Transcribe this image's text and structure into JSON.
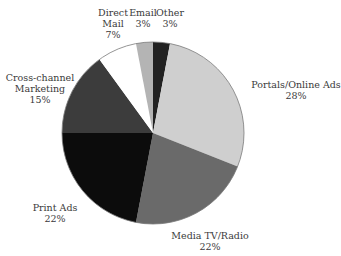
{
  "chart_data": {
    "type": "pie",
    "title": "",
    "start_angle_deg": 0,
    "direction": "clockwise",
    "center": [
      153,
      133
    ],
    "radius": 91,
    "slices": [
      {
        "label": "Other",
        "value": 3,
        "display": "3%",
        "color": "#222222"
      },
      {
        "label": "Portals/Online Ads",
        "value": 28,
        "display": "28%",
        "color": "#cfcfcf"
      },
      {
        "label": "Media TV/Radio",
        "value": 22,
        "display": "22%",
        "color": "#6a6a6a"
      },
      {
        "label": "Print Ads",
        "value": 22,
        "display": "22%",
        "color": "#0c0c0c"
      },
      {
        "label": "Cross-channel Marketing",
        "value": 15,
        "display": "15%",
        "color": "#3c3c3c"
      },
      {
        "label": "Direct Mail",
        "value": 7,
        "display": "7%",
        "color": "#ffffff"
      },
      {
        "label": "Email",
        "value": 3,
        "display": "3%",
        "color": "#b4b4b4"
      }
    ],
    "outline_color": "#7a7a7a"
  },
  "labels": {
    "other": {
      "name": "Other",
      "pct": "3%"
    },
    "portals": {
      "name": "Portals/Online Ads",
      "pct": "28%"
    },
    "media": {
      "name": "Media TV/Radio",
      "pct": "22%"
    },
    "print": {
      "name": "Print Ads",
      "pct": "22%"
    },
    "cross_1": "Cross-channel",
    "cross_2": "Marketing",
    "cross_pct": "15%",
    "direct_1": "Direct",
    "direct_2": "Mail",
    "direct_pct": "7%",
    "email": {
      "name": "Email",
      "pct": "3%"
    }
  }
}
